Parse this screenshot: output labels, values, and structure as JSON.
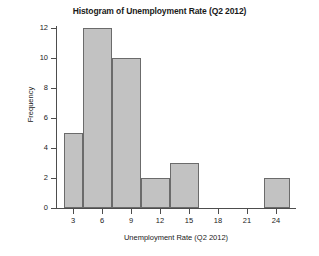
{
  "chart_data": {
    "type": "bar",
    "title": "Histogram of Unemployment Rate (Q2 2012)",
    "xlabel": "Unemployment Rate (Q2 2012)",
    "ylabel": "Frequency",
    "xlim": [
      1.2,
      26.0
    ],
    "ylim": [
      0,
      12
    ],
    "grid": false,
    "legend": null,
    "xticks": [
      3,
      6,
      9,
      12,
      15,
      18,
      21,
      24
    ],
    "xtick_labels": [
      "3",
      "6",
      "9",
      "12",
      "15",
      "18",
      "21",
      "24"
    ],
    "yticks": [
      0,
      2,
      4,
      6,
      8,
      10,
      12
    ],
    "ytick_labels": [
      "0",
      "2",
      "4",
      "6",
      "8",
      "10",
      "12"
    ],
    "bin_width": 3,
    "bins": [
      {
        "left": 2,
        "right": 4,
        "value": 5
      },
      {
        "left": 4,
        "right": 7,
        "value": 12
      },
      {
        "left": 7,
        "right": 10,
        "value": 10
      },
      {
        "left": 10,
        "right": 13,
        "value": 2
      },
      {
        "left": 13,
        "right": 16,
        "value": 3
      },
      {
        "left": 16,
        "right": 19,
        "value": 0
      },
      {
        "left": 19,
        "right": 22,
        "value": 0
      },
      {
        "left": 22.8,
        "right": 25.5,
        "value": 2
      }
    ],
    "categories": [
      "2-4",
      "4-7",
      "7-10",
      "10-13",
      "13-16",
      "16-19",
      "19-22",
      "22.8-25.5"
    ],
    "values": [
      5,
      12,
      10,
      2,
      3,
      0,
      0,
      2
    ],
    "bar_fill_color": "#c2c2c2",
    "bar_edge_color": "#6b6b6b",
    "axis_color": "#4d4d4d",
    "background_color": "#ffffff"
  }
}
